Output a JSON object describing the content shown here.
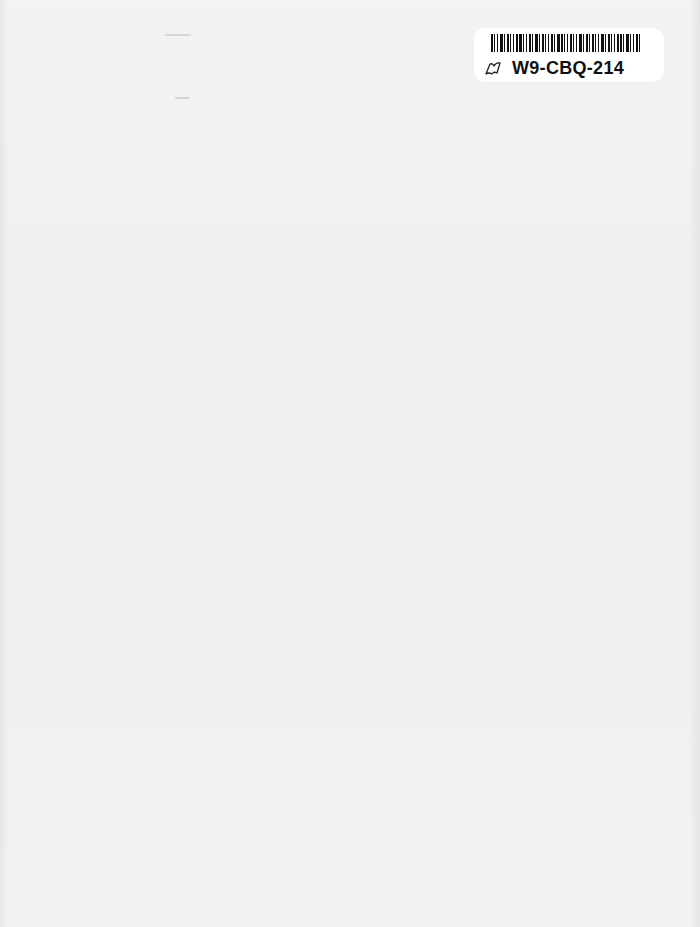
{
  "document": {
    "type": "blank scanned page",
    "background_color": "#f1f1f1"
  },
  "library_sticker": {
    "barcode_label": "W9-CBQ-214",
    "icon": "book-icon"
  }
}
